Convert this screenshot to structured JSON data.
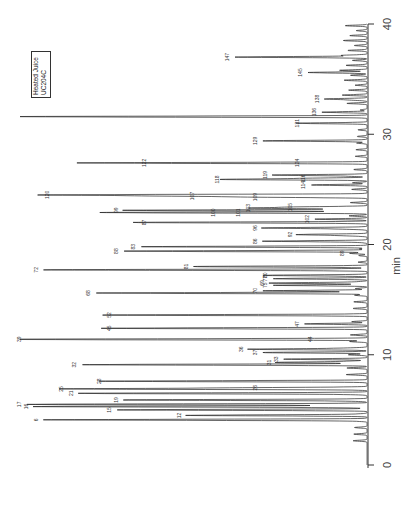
{
  "legend": {
    "line1": "Heated Juice",
    "line2": "UC204C"
  },
  "axis": {
    "xlabel": "min",
    "ticks": [
      "0",
      "10",
      "20",
      "30",
      "40"
    ]
  },
  "chart_data": {
    "type": "line",
    "title": "Heated Juice UC204C",
    "xlabel": "min",
    "ylabel": "",
    "orientation": "rotated-90 (time axis vertical, bottom=0, top=40; signal grows leftward)",
    "xlim": [
      0,
      40
    ],
    "xticks": [
      0,
      10,
      20,
      30,
      40
    ],
    "grid": false,
    "legend_position": "top-left",
    "peaks": [
      {
        "label": "6",
        "t": 4.1,
        "h": 0.93
      },
      {
        "label": "12",
        "t": 4.5,
        "h": 0.52
      },
      {
        "label": "15",
        "t": 5.0,
        "h": 0.72
      },
      {
        "label": "16",
        "t": 5.3,
        "h": 0.96
      },
      {
        "label": "17",
        "t": 5.5,
        "h": 0.98
      },
      {
        "label": "21",
        "t": 6.5,
        "h": 0.83
      },
      {
        "label": "25",
        "t": 6.9,
        "h": 0.86
      },
      {
        "label": "26",
        "t": 7.0,
        "h": 0.3
      },
      {
        "label": "19",
        "t": 5.9,
        "h": 0.7
      },
      {
        "label": "28",
        "t": 7.6,
        "h": 0.75
      },
      {
        "label": "31",
        "t": 9.3,
        "h": 0.26
      },
      {
        "label": "32",
        "t": 9.1,
        "h": 0.82
      },
      {
        "label": "33",
        "t": 9.6,
        "h": 0.24
      },
      {
        "label": "36",
        "t": 10.5,
        "h": 0.34
      },
      {
        "label": "37",
        "t": 10.2,
        "h": 0.3
      },
      {
        "label": "39",
        "t": 11.4,
        "h": 0.98
      },
      {
        "label": "44",
        "t": 11.4,
        "h": 0.14
      },
      {
        "label": "45",
        "t": 12.4,
        "h": 0.72
      },
      {
        "label": "47",
        "t": 12.8,
        "h": 0.18
      },
      {
        "label": "52",
        "t": 13.6,
        "h": 0.72
      },
      {
        "label": "68",
        "t": 15.6,
        "h": 0.78
      },
      {
        "label": "69",
        "t": 16.5,
        "h": 0.28
      },
      {
        "label": "70",
        "t": 15.8,
        "h": 0.3
      },
      {
        "label": "72",
        "t": 17.7,
        "h": 0.93
      },
      {
        "label": "75",
        "t": 16.3,
        "h": 0.27
      },
      {
        "label": "77",
        "t": 16.9,
        "h": 0.27
      },
      {
        "label": "80",
        "t": 17.2,
        "h": 0.27
      },
      {
        "label": "81",
        "t": 18.0,
        "h": 0.5
      },
      {
        "label": "83",
        "t": 19.8,
        "h": 0.65
      },
      {
        "label": "86",
        "t": 20.3,
        "h": 0.3
      },
      {
        "label": "88",
        "t": 19.4,
        "h": 0.7
      },
      {
        "label": "89",
        "t": 19.2,
        "h": 0.05
      },
      {
        "label": "92",
        "t": 20.9,
        "h": 0.2
      },
      {
        "label": "87",
        "t": 22.0,
        "h": 0.62
      },
      {
        "label": "96",
        "t": 21.5,
        "h": 0.3
      },
      {
        "label": "99",
        "t": 23.1,
        "h": 0.7
      },
      {
        "label": "100",
        "t": 22.9,
        "h": 0.42
      },
      {
        "label": "101",
        "t": 22.9,
        "h": 0.35
      },
      {
        "label": "102",
        "t": 22.3,
        "h": 0.15
      },
      {
        "label": "103",
        "t": 23.3,
        "h": 0.32
      },
      {
        "label": "105",
        "t": 23.4,
        "h": 0.2
      },
      {
        "label": "107",
        "t": 24.4,
        "h": 0.48
      },
      {
        "label": "109",
        "t": 24.3,
        "h": 0.3
      },
      {
        "label": "114",
        "t": 25.4,
        "h": 0.16
      },
      {
        "label": "116",
        "t": 26.0,
        "h": 0.16
      },
      {
        "label": "118",
        "t": 25.9,
        "h": 0.41
      },
      {
        "label": "119",
        "t": 26.3,
        "h": 0.27
      },
      {
        "label": "120",
        "t": 24.5,
        "h": 0.9
      },
      {
        "label": "122",
        "t": 27.4,
        "h": 0.62
      },
      {
        "label": "124",
        "t": 27.4,
        "h": 0.18
      },
      {
        "label": "129",
        "t": 29.4,
        "h": 0.3
      },
      {
        "label": "131",
        "t": 31.0,
        "h": 0.18
      },
      {
        "label": "136",
        "t": 32.0,
        "h": 0.13
      },
      {
        "label": "138",
        "t": 33.2,
        "h": 0.12
      },
      {
        "label": "145",
        "t": 35.6,
        "h": 0.17
      },
      {
        "label": "147",
        "t": 37.0,
        "h": 0.38
      },
      {
        "label": "",
        "t": 31.6,
        "h": 1.0
      }
    ]
  }
}
